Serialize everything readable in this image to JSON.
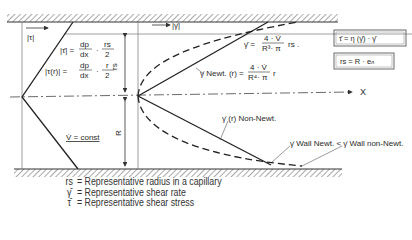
{
  "diagram": {
    "labels": {
      "tau_abs": "|τ|",
      "gamma_abs": "|γ̇|",
      "tau_bar_eq_lhs": "|τ̄| =",
      "tau_bar_eq_num": "dp",
      "tau_bar_eq_den": "dx",
      "tau_bar_eq_frac_num": "rs",
      "tau_bar_eq_frac_den": "2",
      "tau_r_eq_lhs": "|τ(r)| =",
      "tau_r_eq_num": "dp",
      "tau_r_eq_den": "dx",
      "tau_r_eq_frac_num": "r",
      "tau_r_eq_frac_den": "2",
      "vdot_const": "V̇ = const",
      "gamma_bar_eq_lhs": "γ̄ =",
      "gamma_bar_eq_num": "4 · V̇",
      "gamma_bar_eq_den": "R³· π",
      "gamma_bar_eq_tail": "rs .",
      "gamma_newt_lhs": "γ̇ Newt. (r) =",
      "gamma_newt_num": "4 · V̇",
      "gamma_newt_den": "R⁴· π",
      "gamma_newt_tail": "r",
      "gamma_nonnewt": "γ̇ (r) Non-Newt.",
      "wall_compare": "γ̇ Wall Newt. < γ̇ Wall non-Newt.",
      "axis_x": "X",
      "dim_rs": "rs",
      "dim_R": "R",
      "box1": "τ̄ = η (γ̄) · γ̄",
      "box2": "rs = R · eₙ"
    },
    "legend": [
      {
        "symbol": "rs",
        "text": "= Representative radius in a capillary"
      },
      {
        "symbol": "γ̄",
        "text": "= Representative shear rate"
      },
      {
        "symbol": "τ̄",
        "text": "= Representative shear stress"
      }
    ]
  }
}
